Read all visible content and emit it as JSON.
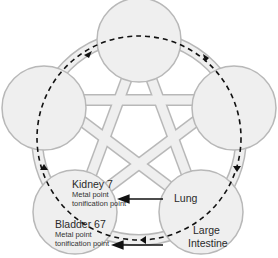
{
  "diagram": {
    "type": "five-element-cycle",
    "colors": {
      "circle_fill": "#efefef",
      "circle_stroke": "#b8b8b8",
      "band_fill": "#efefef",
      "dashed_line": "#111111",
      "arrow": "#111111",
      "text": "#2a2a2a"
    },
    "nodes": [
      {
        "id": "top",
        "label": ""
      },
      {
        "id": "left",
        "label": ""
      },
      {
        "id": "right",
        "label": ""
      },
      {
        "id": "bottom-left",
        "label": ""
      },
      {
        "id": "bottom-right",
        "label": ""
      }
    ],
    "labels": {
      "kidney": "Kidney 7",
      "kidney_sub1": "Metal point",
      "kidney_sub2": "tonification point",
      "bladder": "Bladder 67",
      "bladder_sub1": "Metal point",
      "bladder_sub2": "tonification point",
      "lung": "Lung",
      "large_intestine_1": "Large",
      "large_intestine_2": "Intestine"
    },
    "arrows": [
      {
        "from": "Lung",
        "to": "Kidney 7"
      },
      {
        "from": "Large Intestine",
        "to": "Bladder 67"
      }
    ],
    "cycle_direction": "clockwise"
  }
}
